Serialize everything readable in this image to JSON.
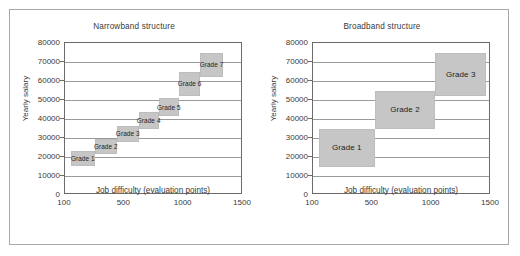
{
  "figure": {
    "panels": [
      {
        "key": "narrowband",
        "title": "Narrowband structure",
        "xlabel": "Job difficulty (evaluation points)",
        "ylabel": "Yearly salary"
      },
      {
        "key": "broadband",
        "title": "Broadband structure",
        "xlabel": "Job difficulty (evaluation points)",
        "ylabel": "Yearly salary"
      }
    ],
    "band_fill_color": "#c6c6c6",
    "frame_color": "#a8a8a8",
    "axis_color": "#6b6b6b",
    "gridline_color": "#9a9a9a"
  },
  "chart_data": [
    {
      "type": "bar",
      "key": "narrowband",
      "title": "Narrowband structure",
      "xlabel": "Job difficulty (evaluation points)",
      "ylabel": "Yearly salary",
      "ylim": [
        0,
        80000
      ],
      "ytick_labels": [
        "0",
        "10000",
        "20000",
        "30000",
        "40000",
        "50000",
        "60000",
        "70000",
        "80000"
      ],
      "yticks": [
        0,
        10000,
        20000,
        30000,
        40000,
        50000,
        60000,
        70000,
        80000
      ],
      "xtick_labels": [
        "100",
        "500",
        "1000",
        "1500"
      ],
      "xticks": [
        100,
        500,
        1000,
        1500
      ],
      "xlim": [
        100,
        1500
      ],
      "grid": true,
      "legend": "none",
      "bands": [
        {
          "label": "Grade 1",
          "x_start": 140,
          "x_end": 300,
          "salary_min": 15000,
          "salary_max": 23000
        },
        {
          "label": "Grade 2",
          "x_start": 300,
          "x_end": 450,
          "salary_min": 21500,
          "salary_max": 29500
        },
        {
          "label": "Grade 3",
          "x_start": 450,
          "x_end": 620,
          "salary_min": 28000,
          "salary_max": 36500
        },
        {
          "label": "Grade 4",
          "x_start": 620,
          "x_end": 790,
          "salary_min": 34500,
          "salary_max": 43500
        },
        {
          "label": "Grade 5",
          "x_start": 790,
          "x_end": 960,
          "salary_min": 41500,
          "salary_max": 51000
        },
        {
          "label": "Grade 6",
          "x_start": 960,
          "x_end": 1140,
          "salary_min": 52000,
          "salary_max": 65000
        },
        {
          "label": "Grade 7",
          "x_start": 1140,
          "x_end": 1330,
          "salary_min": 62000,
          "salary_max": 75000
        }
      ]
    },
    {
      "type": "bar",
      "key": "broadband",
      "title": "Broadband structure",
      "xlabel": "Job difficulty (evaluation points)",
      "ylabel": "Yearly salary",
      "ylim": [
        0,
        80000
      ],
      "ytick_labels": [
        "0",
        "10000",
        "20000",
        "30000",
        "40000",
        "50000",
        "60000",
        "70000",
        "80000"
      ],
      "yticks": [
        0,
        10000,
        20000,
        30000,
        40000,
        50000,
        60000,
        70000,
        80000
      ],
      "xtick_labels": [
        "100",
        "500",
        "1000",
        "1500"
      ],
      "xticks": [
        100,
        500,
        1000,
        1500
      ],
      "xlim": [
        100,
        1500
      ],
      "grid": true,
      "legend": "none",
      "bands": [
        {
          "label": "Grade 1",
          "x_start": 140,
          "x_end": 520,
          "salary_min": 15000,
          "salary_max": 35000
        },
        {
          "label": "Grade 2",
          "x_start": 520,
          "x_end": 1030,
          "salary_min": 35000,
          "salary_max": 55000
        },
        {
          "label": "Grade 3",
          "x_start": 1030,
          "x_end": 1460,
          "salary_min": 52000,
          "salary_max": 75000
        }
      ]
    }
  ]
}
